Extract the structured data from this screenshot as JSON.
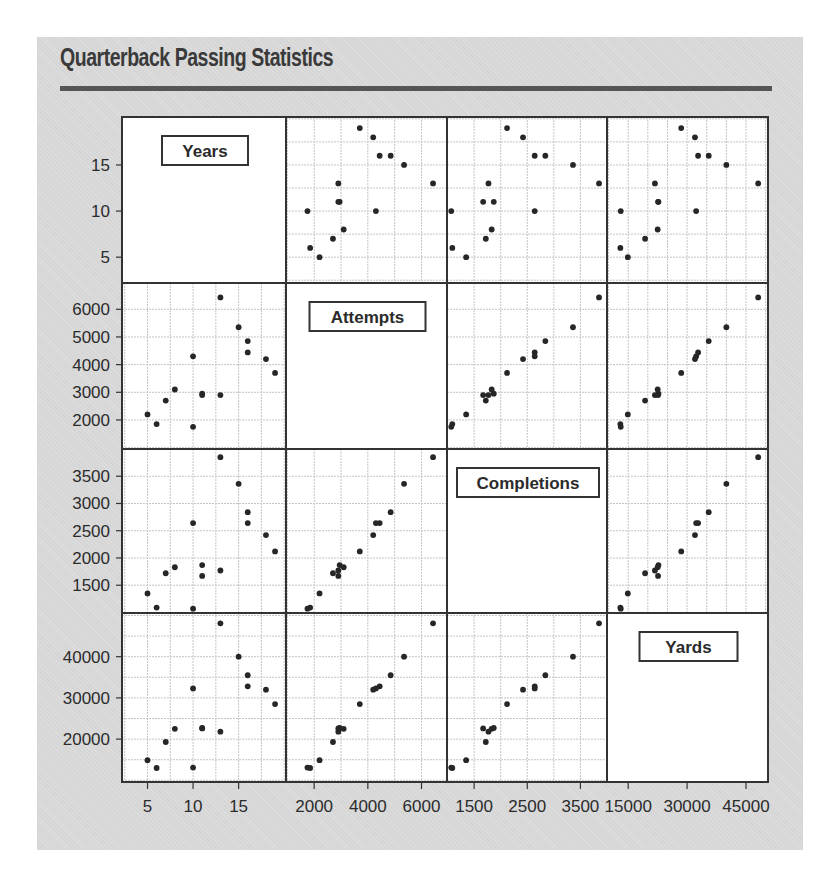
{
  "title": "Quarterback Passing Statistics",
  "chart_data": {
    "type": "scatter",
    "subtype": "scatterplot-matrix",
    "title": "Quarterback Passing Statistics",
    "variables": [
      {
        "name": "Years",
        "range": [
          2.2,
          20.2
        ],
        "ticks": [
          5,
          10,
          15
        ],
        "tick_labels": [
          "5",
          "10",
          "15"
        ],
        "grid_step": 2.5
      },
      {
        "name": "Attempts",
        "range": [
          950,
          6950
        ],
        "ticks": [
          2000,
          3000,
          4000,
          5000,
          6000
        ],
        "tick_labels": [
          "2000",
          "3000",
          "4000",
          "5000",
          "6000"
        ],
        "x_ticks": [
          2000,
          4000,
          6000
        ],
        "x_tick_labels": [
          "2000",
          "4000",
          "6000"
        ],
        "grid_step": 1000
      },
      {
        "name": "Completions",
        "range": [
          990,
          4000
        ],
        "ticks": [
          1500,
          2000,
          2500,
          3000,
          3500
        ],
        "tick_labels": [
          "1500",
          "2000",
          "2500",
          "3000",
          "3500"
        ],
        "x_ticks": [
          1500,
          2500,
          3500
        ],
        "x_tick_labels": [
          "1500",
          "2500",
          "3500"
        ],
        "grid_step": 500
      },
      {
        "name": "Yards",
        "range": [
          9600,
          50600
        ],
        "ticks": [
          20000,
          30000,
          40000
        ],
        "tick_labels": [
          "20000",
          "30000",
          "40000"
        ],
        "x_ticks": [
          15000,
          30000,
          45000
        ],
        "x_tick_labels": [
          "15000",
          "30000",
          "45000"
        ],
        "grid_step": 5000
      }
    ],
    "grid": true,
    "legend": "none",
    "records": [
      {
        "Years": 13,
        "Attempts": 6430,
        "Completions": 3850,
        "Yards": 48100
      },
      {
        "Years": 15,
        "Attempts": 5350,
        "Completions": 3360,
        "Yards": 40000
      },
      {
        "Years": 16,
        "Attempts": 4850,
        "Completions": 2840,
        "Yards": 35500
      },
      {
        "Years": 16,
        "Attempts": 4440,
        "Completions": 2640,
        "Yards": 32800
      },
      {
        "Years": 18,
        "Attempts": 4200,
        "Completions": 2420,
        "Yards": 32000
      },
      {
        "Years": 19,
        "Attempts": 3700,
        "Completions": 2120,
        "Yards": 28500
      },
      {
        "Years": 10,
        "Attempts": 4300,
        "Completions": 2640,
        "Yards": 32300
      },
      {
        "Years": 11,
        "Attempts": 2950,
        "Completions": 1870,
        "Yards": 22700
      },
      {
        "Years": 11,
        "Attempts": 2900,
        "Completions": 1670,
        "Yards": 22600
      },
      {
        "Years": 13,
        "Attempts": 2900,
        "Completions": 1770,
        "Yards": 21800
      },
      {
        "Years": 8,
        "Attempts": 3100,
        "Completions": 1830,
        "Yards": 22500
      },
      {
        "Years": 7,
        "Attempts": 2700,
        "Completions": 1720,
        "Yards": 19300
      },
      {
        "Years": 5,
        "Attempts": 2200,
        "Completions": 1350,
        "Yards": 14900
      },
      {
        "Years": 6,
        "Attempts": 1850,
        "Completions": 1090,
        "Yards": 13000
      },
      {
        "Years": 10,
        "Attempts": 1750,
        "Completions": 1070,
        "Yards": 13100
      }
    ]
  },
  "colors": {
    "background": "#d6d6d6",
    "panel": "#ffffff",
    "border": "#333333",
    "grid": "#c4c4c4",
    "point": "#262626",
    "title_rule": "#555555"
  }
}
